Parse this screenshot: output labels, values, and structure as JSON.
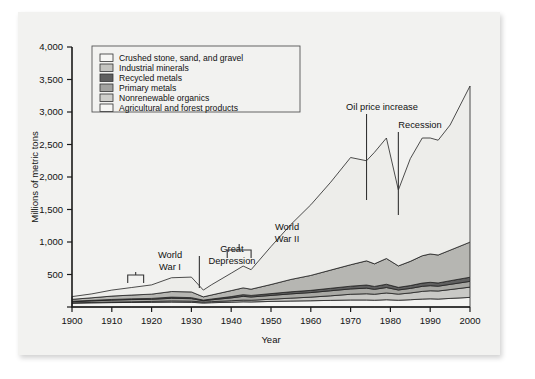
{
  "chart_data": {
    "type": "area",
    "stacked": true,
    "title": "",
    "xlabel": "Year",
    "ylabel": "Millions of metric tons",
    "xlim": [
      1900,
      2000
    ],
    "ylim": [
      0,
      4000
    ],
    "ytick_values": [
      0,
      500,
      1000,
      1500,
      2000,
      2500,
      3000,
      3500,
      4000
    ],
    "ytick_labels": [
      "0",
      "500",
      "1,000",
      "1,500",
      "2,000",
      "2,500",
      "3,000",
      "3,500",
      "4,000"
    ],
    "xtick_values": [
      1900,
      1910,
      1920,
      1930,
      1940,
      1950,
      1960,
      1970,
      1980,
      1990,
      2000
    ],
    "xtick_labels": [
      "1900",
      "1910",
      "1920",
      "1930",
      "1940",
      "1950",
      "1960",
      "1970",
      "1980",
      "1990",
      "2000"
    ],
    "grid": false,
    "legend_position": "top-left",
    "x": [
      1900,
      1905,
      1910,
      1915,
      1920,
      1925,
      1930,
      1933,
      1935,
      1940,
      1943,
      1945,
      1950,
      1955,
      1960,
      1965,
      1970,
      1974,
      1976,
      1979,
      1982,
      1985,
      1988,
      1990,
      1992,
      1995,
      2000
    ],
    "series": [
      {
        "name": "Agricultural and forest products",
        "color": "#f4f4f2",
        "values": [
          60,
          64,
          68,
          70,
          72,
          76,
          72,
          62,
          66,
          74,
          80,
          78,
          86,
          92,
          96,
          102,
          108,
          108,
          104,
          112,
          104,
          112,
          122,
          126,
          122,
          132,
          148
        ]
      },
      {
        "name": "Nonrenewable organics",
        "color": "#c9c9c6",
        "values": [
          4,
          6,
          8,
          10,
          14,
          18,
          18,
          14,
          16,
          22,
          26,
          26,
          34,
          44,
          56,
          70,
          88,
          96,
          92,
          104,
          94,
          104,
          118,
          124,
          124,
          136,
          158
        ]
      },
      {
        "name": "Primary metals",
        "color": "#a8a8a4",
        "values": [
          18,
          24,
          30,
          34,
          32,
          40,
          38,
          20,
          28,
          44,
          58,
          50,
          58,
          66,
          70,
          78,
          82,
          86,
          76,
          84,
          64,
          70,
          78,
          78,
          74,
          80,
          88
        ]
      },
      {
        "name": "Recycled metals",
        "color": "#606060",
        "values": [
          6,
          8,
          10,
          12,
          14,
          18,
          16,
          10,
          12,
          20,
          26,
          24,
          28,
          32,
          34,
          38,
          42,
          48,
          44,
          50,
          40,
          44,
          50,
          52,
          50,
          56,
          64
        ]
      },
      {
        "name": "Industrial minerals",
        "color": "#b6b6b2",
        "values": [
          30,
          40,
          52,
          58,
          66,
          86,
          88,
          50,
          62,
          92,
          104,
          96,
          140,
          190,
          230,
          280,
          330,
          372,
          348,
          396,
          330,
          372,
          420,
          436,
          430,
          470,
          540
        ]
      },
      {
        "name": "Crushed stone, sand, and gravel",
        "color": "#ededea",
        "values": [
          42,
          60,
          92,
          116,
          142,
          212,
          228,
          104,
          156,
          268,
          336,
          300,
          584,
          846,
          1086,
          1352,
          1650,
          1540,
          1716,
          1854,
          1168,
          1580,
          1812,
          1784,
          1766,
          1926,
          2402
        ]
      }
    ],
    "annotations": [
      {
        "label": "World War I",
        "kind": "bracket",
        "x_start": 1914,
        "x_end": 1918
      },
      {
        "label": "Great Depression",
        "kind": "pointer",
        "x": 1932
      },
      {
        "label": "World War II",
        "kind": "bracket",
        "x_start": 1939,
        "x_end": 1945
      },
      {
        "label": "Oil price increase",
        "kind": "pointer",
        "x": 1974
      },
      {
        "label": "Recession",
        "kind": "pointer",
        "x": 1982
      }
    ]
  },
  "legend": {
    "items": [
      {
        "label": "Crushed stone, sand, and gravel",
        "color": "#f6f6f4"
      },
      {
        "label": "Industrial minerals",
        "color": "#c4c4c0"
      },
      {
        "label": "Recycled metals",
        "color": "#5f5f5f"
      },
      {
        "label": "Primary metals",
        "color": "#a3a3a0"
      },
      {
        "label": "Nonrenewable organics",
        "color": "#cfcfcb"
      },
      {
        "label": "Agricultural and forest products",
        "color": "#f6f6f4"
      }
    ]
  }
}
